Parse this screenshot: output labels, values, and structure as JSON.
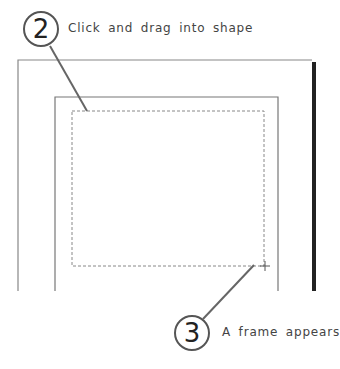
{
  "steps": [
    {
      "number": "2",
      "text": "Click and drag into shape"
    },
    {
      "number": "3",
      "text": "A frame appears"
    }
  ],
  "colors": {
    "line": "#777777",
    "thick_bar": "#222222",
    "dashed": "#888888",
    "leader": "#666666"
  }
}
